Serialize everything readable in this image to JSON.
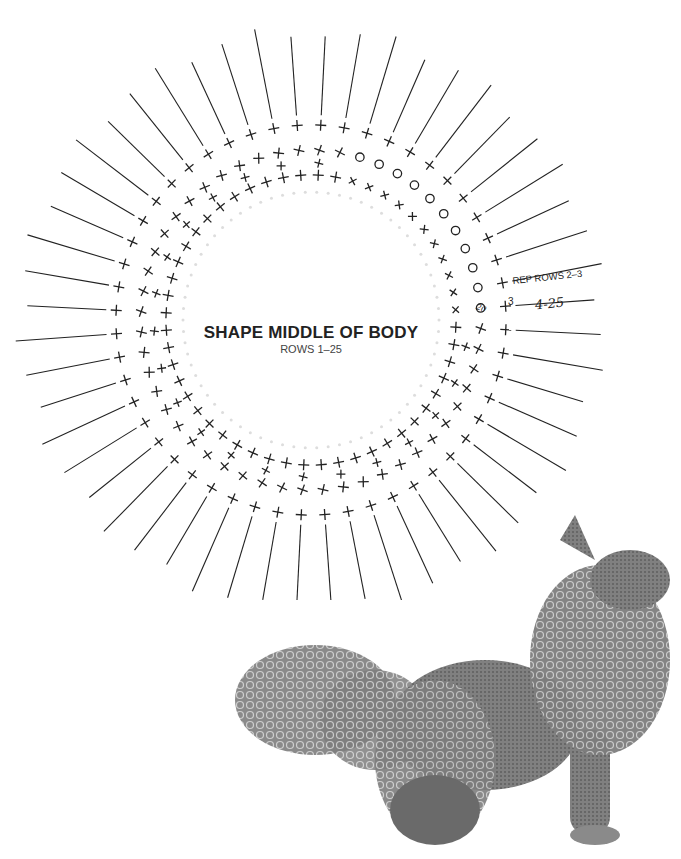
{
  "diagram": {
    "title": "SHAPE MIDDLE OF BODY",
    "subtitle": "ROWS 1–25",
    "annotation_repeat": "REP ROWS 2–3",
    "annotation_handwritten_rows": "4-25",
    "annotation_handwritten_count": "20",
    "row_marker_label": "3",
    "row_marker_label_2": "2",
    "center": [
      311,
      320
    ],
    "spoke_count": 52,
    "rings": [
      {
        "name": "inner",
        "radius": 145,
        "symbol": "+"
      },
      {
        "name": "middle",
        "radius": 170,
        "symbol": "+"
      },
      {
        "name": "outer",
        "radius": 195,
        "symbol": "+"
      }
    ],
    "spoke_inner_radius": 205,
    "spoke_outer_radius": 290,
    "stitch_colors": {
      "ink": "#222222",
      "faint": "#dddddd"
    }
  },
  "photo": {
    "subject": "crocheted loop-stitch fox / dog toy",
    "alt": "Crocheted shaggy animal toy with looped fur tail and mane"
  }
}
